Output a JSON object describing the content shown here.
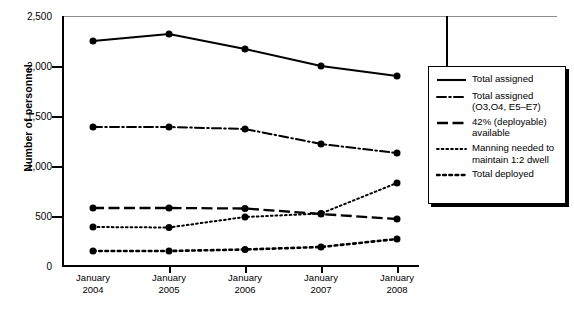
{
  "chart": {
    "ylabel": "Number of personnel",
    "yticks": [
      "0",
      "500",
      "1,000",
      "1,500",
      "2,000",
      "2,500"
    ],
    "xticks": [
      {
        "line1": "January",
        "line2": "2004"
      },
      {
        "line1": "January",
        "line2": "2005"
      },
      {
        "line1": "January",
        "line2": "2006"
      },
      {
        "line1": "January",
        "line2": "2007"
      },
      {
        "line1": "January",
        "line2": "2008"
      }
    ],
    "legend": [
      {
        "label": "Total assigned",
        "style": "solid"
      },
      {
        "label": "Total assigned (O3,O4, E5–E7)",
        "style": "dash-dot"
      },
      {
        "label": "42% (deployable) available",
        "style": "dashed"
      },
      {
        "label": "Manning needed to maintain 1:2 dwell",
        "style": "fine-dotted"
      },
      {
        "label": "Total deployed",
        "style": "coarse-dotted"
      }
    ]
  },
  "chart_data": {
    "type": "line",
    "title": "",
    "xlabel": "",
    "ylabel": "Number of personnel",
    "categories": [
      "January 2004",
      "January 2005",
      "January 2006",
      "January 2007",
      "January 2008"
    ],
    "ylim": [
      0,
      2500
    ],
    "ytick_values": [
      0,
      500,
      1000,
      1500,
      2000,
      2500
    ],
    "grid": false,
    "legend_position": "right",
    "series": [
      {
        "name": "Total assigned",
        "style": "solid",
        "marker": "circle",
        "values": [
          2250,
          2320,
          2170,
          2000,
          1900
        ]
      },
      {
        "name": "Total assigned (O3,O4, E5–E7)",
        "style": "dash-dot",
        "marker": "circle",
        "values": [
          1390,
          1390,
          1370,
          1220,
          1130
        ]
      },
      {
        "name": "42% (deployable) available",
        "style": "dashed",
        "marker": "circle",
        "values": [
          580,
          580,
          575,
          520,
          470
        ]
      },
      {
        "name": "Manning needed to maintain 1:2 dwell",
        "style": "fine-dotted",
        "marker": "circle",
        "values": [
          390,
          385,
          490,
          525,
          830
        ]
      },
      {
        "name": "Total deployed",
        "style": "coarse-dotted",
        "marker": "circle",
        "values": [
          150,
          150,
          165,
          190,
          270
        ]
      }
    ]
  }
}
